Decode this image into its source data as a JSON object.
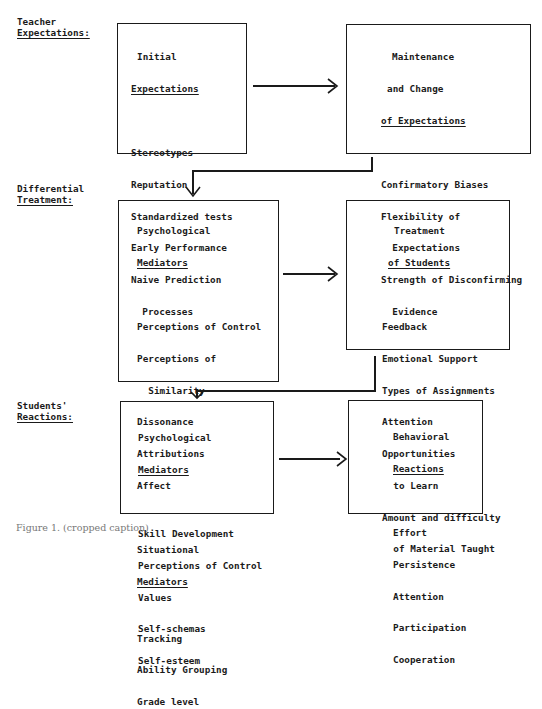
{
  "rows": [
    {
      "label_line1": "Teacher",
      "label_line2": "Expectations:"
    },
    {
      "label_line1": "Differential",
      "label_line2": "Treatment:"
    },
    {
      "label_line1": "Students'",
      "label_line2": "Reactions:"
    }
  ],
  "boxes": {
    "initial_expectations": {
      "title_line1": "Initial",
      "title_line2": "Expectations",
      "items": [
        "Stereotypes",
        "Reputation",
        "Standardized tests",
        "Early Performance",
        "Naive Prediction",
        "  Processes"
      ]
    },
    "maintenance_change": {
      "title_line1": "Maintenance",
      "title_line2": "and Change",
      "title_line3": "of Expectations",
      "items": [
        "Confirmatory Biases",
        "Flexibility of",
        "  Expectations",
        "Strength of Disconfirming",
        "  Evidence"
      ]
    },
    "psych_mediators_teacher": {
      "title_line1": "Psychological",
      "title_line2": "Mediators",
      "items": [
        "Perceptions of Control",
        "Perceptions of",
        "  Similarity",
        "Dissonance",
        "Attributions",
        "Affect"
      ],
      "sub_title_line1": "Situational",
      "sub_title_line2": "Mediators",
      "sub_items": [
        "Tracking",
        "Ability Grouping",
        "Grade level"
      ]
    },
    "treatment_students": {
      "title_line1": "Treatment",
      "title_line2": "of Students",
      "items": [
        "Feedback",
        "Emotional Support",
        "Types of Assignments",
        "Attention",
        "Opportunities",
        "  to Learn",
        "Amount and difficulty",
        "  of Material Taught"
      ]
    },
    "psych_mediators_students": {
      "title_line1": "Psychological",
      "title_line2": "Mediators",
      "items": [
        "Skill Development",
        "Perceptions of Control",
        "Values",
        "Self-schemas",
        "Self-esteem"
      ]
    },
    "behavioral_reactions": {
      "title_line1": "Behavioral",
      "title_line2": "Reactions",
      "items": [
        "Effort",
        "Persistence",
        "Attention",
        "Participation",
        "Cooperation"
      ]
    }
  },
  "caption": "Figure 1. (cropped caption)"
}
